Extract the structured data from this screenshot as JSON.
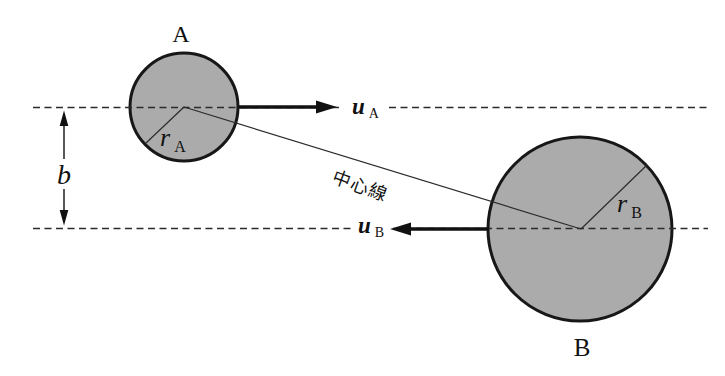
{
  "figure": {
    "labels": {
      "sphere_a": "A",
      "sphere_b": "B",
      "velocity_a": {
        "main": "u",
        "sub": "A"
      },
      "velocity_b": {
        "main": "u",
        "sub": "B"
      },
      "radius_a": {
        "main": "r",
        "sub": "A"
      },
      "radius_b": {
        "main": "r",
        "sub": "B"
      },
      "impact_parameter": "b",
      "center_line": "中心線"
    },
    "colors": {
      "background": "#ffffff",
      "sphere_fill": "#ababab",
      "sphere_stroke": "#171717",
      "line": "#2b2b2b",
      "arrow": "#111111",
      "text": "#111111"
    }
  }
}
